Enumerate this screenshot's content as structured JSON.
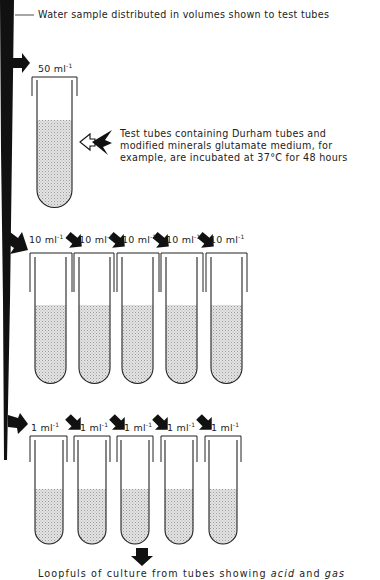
{
  "colors": {
    "ink": "#111111",
    "fill_stipple": "#d4d4d4",
    "background": "#ffffff"
  },
  "header_caption": "Water sample distributed in volumes shown to test tubes",
  "stage1": {
    "volume_label": "50 ml",
    "volume_exp": "-1",
    "tube_count": 1,
    "note_lines": [
      "Test tubes containing Durham tubes and",
      "modified minerals glutamate medium, for",
      "example, are incubated at 37°C for 48 hours"
    ],
    "note_icon": "double-pointing-arrow-icon"
  },
  "stage2": {
    "volume_label": "10 ml",
    "volume_exp": "-1",
    "tube_count": 5,
    "labels": [
      "10 ml",
      "10 ml",
      "10 ml",
      "10 ml",
      "10 ml"
    ]
  },
  "stage3": {
    "volume_label": "1 ml",
    "volume_exp": "-1",
    "tube_count": 5,
    "labels": [
      "1 ml",
      "1 ml",
      "1 ml",
      "1 ml",
      "1 ml"
    ]
  },
  "footer_caption": {
    "prefix": "Loopfuls of culture from tubes showing ",
    "italic1": "acid",
    "middle": " and ",
    "italic2": "gas"
  }
}
